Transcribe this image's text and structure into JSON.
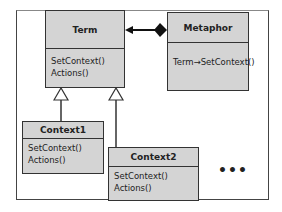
{
  "diagram": {
    "classes": {
      "term": {
        "name": "Term",
        "operations": [
          "SetContext()",
          "Actions()"
        ]
      },
      "metaphor": {
        "name": "Metaphor",
        "operations": [
          "Term→SetContext()"
        ]
      },
      "context1": {
        "name": "Context1",
        "operations": [
          "SetContext()",
          "Actions()"
        ]
      },
      "context2": {
        "name": "Context2",
        "operations": [
          "SetContext()",
          "Actions()"
        ]
      }
    },
    "relations": [
      {
        "type": "composition",
        "from": "Metaphor",
        "to": "Term"
      },
      {
        "type": "generalization",
        "from": "Context1",
        "to": "Term"
      },
      {
        "type": "generalization",
        "from": "Context2",
        "to": "Term"
      }
    ],
    "ellipsis": "•••",
    "colors": {
      "class_fill": "#d4d4d4",
      "border": "#333333"
    }
  }
}
